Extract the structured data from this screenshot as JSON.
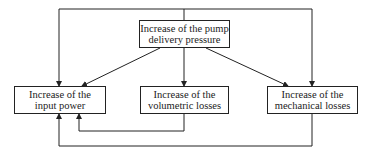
{
  "diagram": {
    "nodes": {
      "top": {
        "line1": "Increase of the pump",
        "line2": "delivery pressure"
      },
      "left": {
        "line1": "Increase of the",
        "line2": "input power"
      },
      "middle": {
        "line1": "Increase of the",
        "line2": "volumetric losses"
      },
      "right": {
        "line1": "Increase of the",
        "line2": "mechanical losses"
      }
    },
    "edges": [
      {
        "from": "top",
        "to": "left"
      },
      {
        "from": "top",
        "to": "middle"
      },
      {
        "from": "top",
        "to": "right"
      },
      {
        "from": "top",
        "to": "left",
        "route": "outer-frame"
      },
      {
        "from": "top",
        "to": "right",
        "route": "outer-frame"
      },
      {
        "from": "middle",
        "to": "left",
        "route": "below"
      },
      {
        "from": "right",
        "to": "left",
        "route": "below"
      }
    ],
    "line_color": "#222222"
  }
}
